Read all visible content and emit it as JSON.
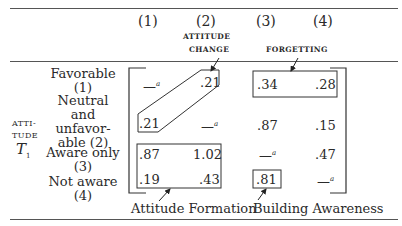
{
  "table": {
    "column_numbers": [
      "(1)",
      "(2)",
      "(3)",
      "(4)"
    ],
    "column_annotations": {
      "attitude_change": [
        "ATTITUDE",
        "CHANGE"
      ],
      "forgetting": "FORGETTING"
    },
    "row_axis_label": {
      "line1": "ATTI-",
      "line2": "TUDE",
      "symbol": "T",
      "subscript": "1"
    },
    "rows": [
      {
        "label_lines": [
          "Favorable",
          "(1)"
        ],
        "cells": [
          "—",
          ".21",
          ".34",
          ".28"
        ]
      },
      {
        "label_lines": [
          "Neutral and",
          "unfavor-",
          "able (2)"
        ],
        "cells": [
          ".21",
          "—",
          ".87",
          ".15"
        ]
      },
      {
        "label_lines": [
          "Aware only",
          "(3)"
        ],
        "cells": [
          ".87",
          "1.02",
          "—",
          ".47"
        ]
      },
      {
        "label_lines": [
          "Not aware",
          "(4)"
        ],
        "cells": [
          ".19",
          ".43",
          ".81",
          "—"
        ]
      }
    ],
    "footnote_marker": "a",
    "bottom_annotations": [
      "Attitude Formation",
      "Building Awareness"
    ]
  }
}
